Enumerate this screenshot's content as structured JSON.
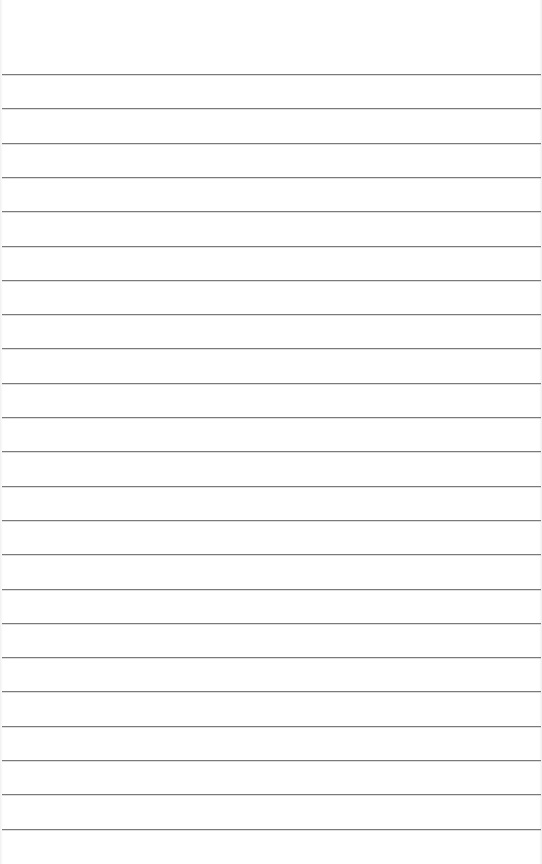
{
  "page": {
    "type": "lined-paper",
    "background_color": "#ffffff",
    "rule_color": "#7a7a7a",
    "rule_count": 23,
    "first_rule_y": 74,
    "rule_spacing": 34.3
  }
}
